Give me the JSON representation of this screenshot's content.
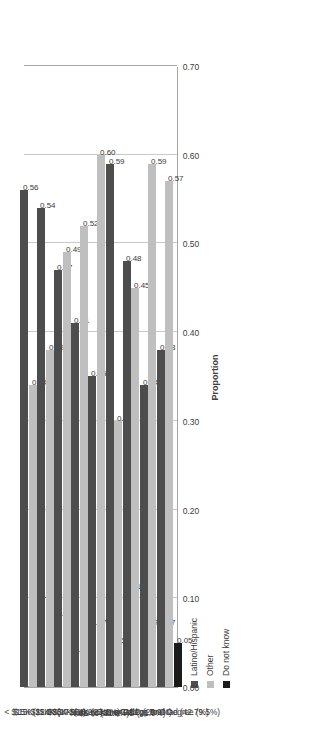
{
  "chart_data": {
    "type": "bar",
    "orientation": "vertical-rendered-sideways",
    "title": "",
    "xlabel": "",
    "ylabel": "Proportion",
    "ylim": [
      0.0,
      0.7
    ],
    "ytick_labels": [
      "0.00",
      "0.10",
      "0.20",
      "0.30",
      "0.40",
      "0.50",
      "0.60",
      "0.70"
    ],
    "ytick_values": [
      0.0,
      0.1,
      0.2,
      0.3,
      0.4,
      0.5,
      0.6,
      0.7
    ],
    "grid": true,
    "legend_position": "top-right",
    "categories": [
      "< $15K (11.1%)",
      "$15K-$24K (17.9%)",
      "$25K-$34K (16.9%)",
      "$35K-$54K (23.1%)",
      "> $54K (31.0%)",
      "None to some HS (21.9%)",
      "HS or GED (25.9%)",
      "Some College to Grad (42.7%)",
      "Grad or Prof Degree (9.5%)"
    ],
    "series": [
      {
        "name": "Latino/Hispanic",
        "color": "#4d4d4d",
        "values": [
          0.56,
          0.54,
          0.47,
          0.41,
          0.35,
          0.59,
          0.48,
          0.34,
          0.38
        ],
        "labels": [
          "0.56",
          "0.54",
          "0.47",
          "0.41",
          "0.35",
          "0.59",
          "0.48",
          "0.34",
          "0.38"
        ]
      },
      {
        "name": "Other",
        "color": "#bfbfbf",
        "values": [
          0.34,
          0.38,
          0.49,
          0.52,
          0.6,
          0.3,
          0.45,
          0.59,
          0.57
        ],
        "labels": [
          "0.34",
          "0.38",
          "0.49",
          "0.52",
          "0.60",
          "0.30",
          "0.45",
          "0.59",
          "0.57"
        ]
      },
      {
        "name": "Do not know",
        "color": "#1a1a1a",
        "values": [
          0.1,
          0.08,
          0.04,
          0.07,
          0.05,
          0.11,
          0.07,
          0.07,
          0.05
        ],
        "labels": [
          "0.10",
          "0.08",
          "0.04",
          "0.07",
          "0.05",
          "0.11",
          "0.07",
          "0.07",
          "0.05"
        ]
      }
    ]
  },
  "legend": {
    "items": [
      {
        "label": "Latino/Hispanic",
        "color": "#4d4d4d"
      },
      {
        "label": "Other",
        "color": "#bfbfbf"
      },
      {
        "label": "Do not know",
        "color": "#1a1a1a"
      }
    ]
  },
  "axis": {
    "value_axis_title": "Proportion"
  }
}
